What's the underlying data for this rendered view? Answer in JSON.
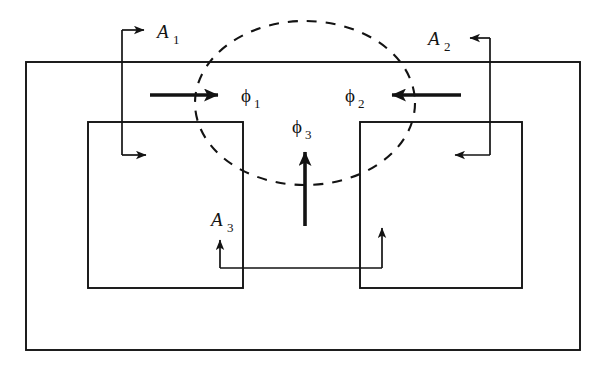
{
  "figure": {
    "background_color": "#ffffff",
    "line_color": "#131313",
    "labels": {
      "a1": "A",
      "a1_sub": "1",
      "a2": "A",
      "a2_sub": "2",
      "a3": "A",
      "a3_sub": "3",
      "phi1": "ϕ",
      "phi1_sub": "1",
      "phi2": "ϕ",
      "phi2_sub": "2",
      "phi3": "ϕ",
      "phi3_sub": "3"
    },
    "shapes": {
      "outer_rectangle": {
        "x": 26,
        "y": 62,
        "width": 554,
        "height": 288
      },
      "left_box": {
        "x": 88,
        "y": 122,
        "width": 155,
        "height": 166
      },
      "right_box": {
        "x": 360,
        "y": 122,
        "width": 162,
        "height": 166
      },
      "dashed_ellipse": {
        "cx": 305,
        "cy": 103,
        "rx": 110,
        "ry": 82,
        "dash": "10 9"
      }
    },
    "flux_arrows": [
      {
        "name": "phi1",
        "direction": "right",
        "x1": 150,
        "y1": 95,
        "x2": 232,
        "y2": 95
      },
      {
        "name": "phi2",
        "direction": "left",
        "x1": 461,
        "y1": 95,
        "x2": 378,
        "y2": 95
      },
      {
        "name": "phi3",
        "direction": "up",
        "x1": 305,
        "y1": 226,
        "x2": 305,
        "y2": 140
      }
    ],
    "potential_paths": [
      {
        "name": "a1",
        "description": "top-left path with two right-pointing arrows"
      },
      {
        "name": "a2",
        "description": "top-right path with two left-pointing arrows"
      },
      {
        "name": "a3",
        "description": "bottom path with two up-pointing arrows"
      }
    ]
  }
}
